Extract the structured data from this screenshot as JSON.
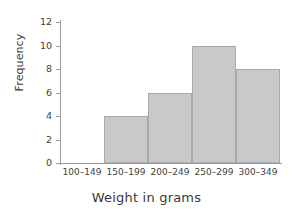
{
  "chart_data": {
    "type": "bar",
    "title": "",
    "xlabel": "Weight in grams",
    "ylabel": "Frequency",
    "categories": [
      "100–149",
      "150–199",
      "200–249",
      "250–299",
      "300–349"
    ],
    "values": [
      0,
      4,
      6,
      10,
      8
    ],
    "ylim": [
      0,
      12
    ],
    "yticks": [
      0,
      2,
      4,
      6,
      8,
      10,
      12
    ],
    "ytick_labels": [
      "0",
      "2",
      "4",
      "6",
      "8",
      "10",
      "12"
    ],
    "grid": false,
    "legend": null,
    "bar_color": "#c9c9c9",
    "bar_border_color": "#a9a9a9",
    "axis_color": "#9d9d9d",
    "text_color": "#3f3f3f"
  }
}
